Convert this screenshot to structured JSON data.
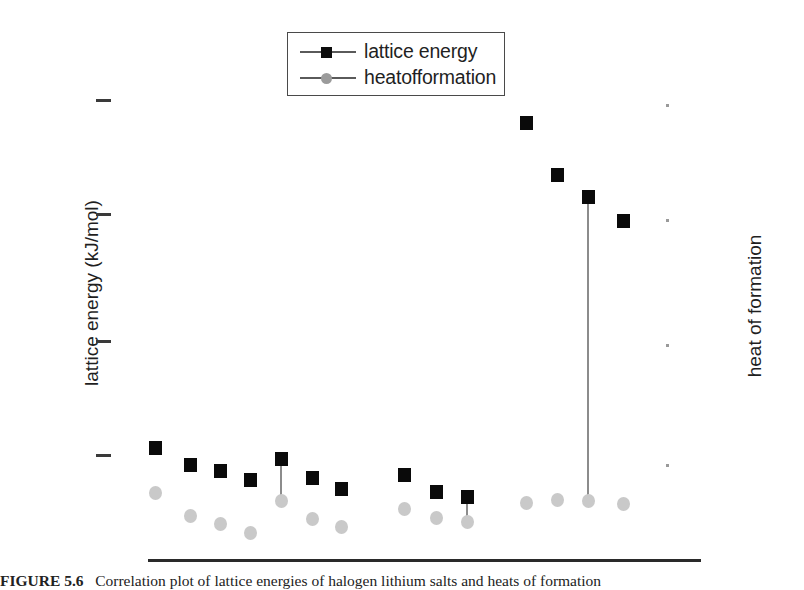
{
  "figure": {
    "caption_label": "FIGURE 5.6",
    "caption_text": "Correlation plot of lattice energies of halogen lithium salts and heats of formation"
  },
  "legend": {
    "position": "top-center",
    "entries": [
      {
        "label": "lattice energy",
        "marker": "square",
        "color": "#0a0a0a"
      },
      {
        "label": "heatofformation",
        "marker": "circle",
        "color": "#c9c9c9"
      }
    ]
  },
  "axes": {
    "left": {
      "label": "lattice energy (kJ/mol)",
      "tick_count": 4
    },
    "right": {
      "label": "heat of formation",
      "tick_count": 4
    }
  },
  "chart_data": {
    "type": "scatter",
    "title": "",
    "xlabel": "",
    "ylabel": "lattice energy (kJ/mol)",
    "y2label": "heat of formation",
    "grid": false,
    "legend_position": "top-center",
    "x": [
      1,
      2,
      3,
      4,
      5,
      6,
      7,
      8,
      9,
      10,
      11,
      12,
      13
    ],
    "xlim": [
      0,
      14
    ],
    "ylim": [
      0,
      100
    ],
    "y2lim": [
      0,
      100
    ],
    "series": [
      {
        "name": "lattice energy",
        "marker": "square",
        "color": "#0a0a0a",
        "axis": "left",
        "values": [
          22.5,
          18.8,
          17.6,
          15.8,
          21.0,
          16.9,
          14.6,
          17.4,
          13.9,
          94.5,
          82.5,
          76.0,
          70.5
        ]
      },
      {
        "name": "heatofformation",
        "marker": "circle",
        "color": "#c9c9c9",
        "axis": "right",
        "values": [
          13.6,
          8.5,
          6.7,
          4.9,
          12.9,
          7.9,
          6.0,
          10.2,
          5.5,
          12.5,
          11.8,
          11.4,
          10.8
        ]
      }
    ],
    "annotations": [
      {
        "type": "drop-line",
        "x": 10,
        "from": 94.5,
        "to": 12.5,
        "color": "#8c8c8c"
      },
      {
        "type": "drop-line",
        "x": 5,
        "from": 21.0,
        "to": 12.9,
        "color": "#8c8c8c"
      },
      {
        "type": "drop-line",
        "x": 13,
        "from": 70.5,
        "to": 10.8,
        "color": "#8c8c8c"
      }
    ]
  },
  "layout": {
    "pixels": {
      "plot_left": 110,
      "plot_right": 660,
      "plot_top": 95,
      "plot_bottom": 540,
      "square_px": [
        {
          "x": 155,
          "y": 448
        },
        {
          "x": 190,
          "y": 465
        },
        {
          "x": 220,
          "y": 471
        },
        {
          "x": 250,
          "y": 480
        },
        {
          "x": 281,
          "y": 459
        },
        {
          "x": 312,
          "y": 478
        },
        {
          "x": 341,
          "y": 489
        },
        {
          "x": 404,
          "y": 475
        },
        {
          "x": 436,
          "y": 492
        },
        {
          "x": 467,
          "y": 497
        },
        {
          "x": 526,
          "y": 123
        },
        {
          "x": 557,
          "y": 175
        },
        {
          "x": 588,
          "y": 197
        },
        {
          "x": 623,
          "y": 221
        }
      ],
      "circle_px": [
        {
          "x": 155,
          "y": 493
        },
        {
          "x": 190,
          "y": 516
        },
        {
          "x": 220,
          "y": 524
        },
        {
          "x": 250,
          "y": 533
        },
        {
          "x": 281,
          "y": 501
        },
        {
          "x": 312,
          "y": 519
        },
        {
          "x": 341,
          "y": 527
        },
        {
          "x": 404,
          "y": 509
        },
        {
          "x": 436,
          "y": 518
        },
        {
          "x": 467,
          "y": 522
        },
        {
          "x": 526,
          "y": 503
        },
        {
          "x": 557,
          "y": 500
        },
        {
          "x": 588,
          "y": 501
        },
        {
          "x": 623,
          "y": 504
        }
      ],
      "left_ticks_y": [
        100,
        214,
        341,
        455
      ],
      "right_ticks_y": [
        105,
        220,
        345,
        465
      ]
    }
  }
}
